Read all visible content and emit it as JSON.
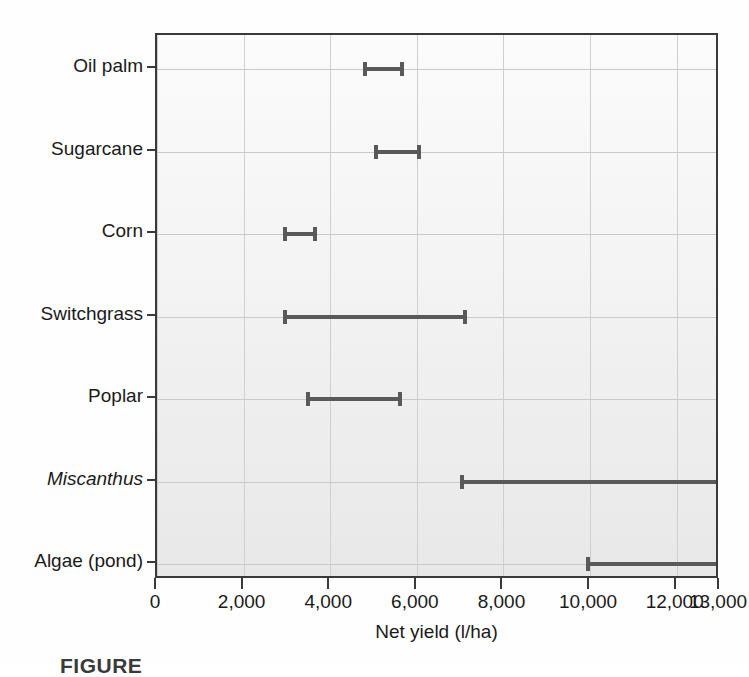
{
  "chart_data": {
    "type": "bar",
    "chart_style": "range-interval / dumbbell (horizontal error-bar ranges)",
    "title": "",
    "xlabel": "Net yield (l/ha)",
    "ylabel": "",
    "xlim": [
      0,
      13000
    ],
    "grid": "both",
    "legend": "none",
    "categories": [
      "Oil palm",
      "Sugarcane",
      "Corn",
      "Switchgrass",
      "Poplar",
      "Miscanthus",
      "Algae (pond)"
    ],
    "category_styles": [
      "normal",
      "normal",
      "normal",
      "normal",
      "normal",
      "italic",
      "normal"
    ],
    "ranges": [
      {
        "category": "Oil palm",
        "low": 4750,
        "high": 5700
      },
      {
        "category": "Sugarcane",
        "low": 5000,
        "high": 6100
      },
      {
        "category": "Corn",
        "low": 2900,
        "high": 3700
      },
      {
        "category": "Switchgrass",
        "low": 2900,
        "high": 7150
      },
      {
        "category": "Poplar",
        "low": 3450,
        "high": 5650
      },
      {
        "category": "Miscanthus",
        "low": 7000,
        "high": 13000
      },
      {
        "category": "Algae (pond)",
        "low": 9900,
        "high": 13000
      }
    ],
    "xticks": [
      0,
      2000,
      4000,
      6000,
      8000,
      10000,
      12000,
      13000
    ],
    "xticklabels": [
      "0",
      "2,000",
      "4,000",
      "6,000",
      "8,000",
      "10,000",
      "12,000",
      "13,000"
    ],
    "colors": {
      "marker": "#595959",
      "frame": "#3a3a3a",
      "grid": "#cfcfcf",
      "plot_background": "#f4f4f4",
      "text": "#1a1a1a"
    }
  },
  "caption": {
    "text": "FIGURE"
  }
}
